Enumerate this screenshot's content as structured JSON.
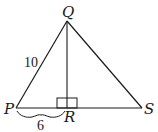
{
  "diagram": {
    "type": "geometry-triangle",
    "points": {
      "P": {
        "label": "P",
        "x": 16,
        "y": 108
      },
      "Q": {
        "label": "Q",
        "x": 67,
        "y": 21
      },
      "R": {
        "label": "R",
        "x": 67,
        "y": 108
      },
      "S": {
        "label": "S",
        "x": 142,
        "y": 108
      }
    },
    "segments": [
      "PQ",
      "QS",
      "PS",
      "QR"
    ],
    "right_angle_at": "R",
    "measurements": {
      "PQ": "10",
      "PR": "6"
    },
    "colors": {
      "stroke": "#1a1a1a",
      "background": "#ffffff"
    }
  }
}
